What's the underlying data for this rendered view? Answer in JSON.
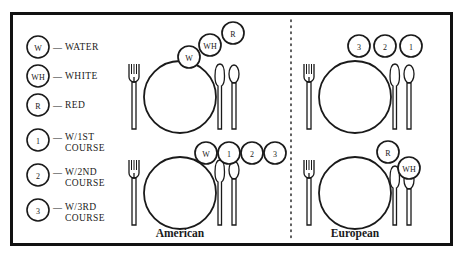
{
  "figure": {
    "title_visible": false,
    "background_color": "#ffffff",
    "ink_color": "#1a1a1a",
    "border": {
      "color": "#111111",
      "width_px": 3
    }
  },
  "legend": {
    "name": "glassware-legend",
    "items": [
      {
        "id": "W",
        "symbol": "W",
        "dash": "—",
        "label": "WATER",
        "label2": ""
      },
      {
        "id": "WH",
        "symbol": "WH",
        "dash": "—",
        "label": "WHITE",
        "label2": ""
      },
      {
        "id": "R",
        "symbol": "R",
        "dash": "—",
        "label": "RED",
        "label2": ""
      },
      {
        "id": "1",
        "symbol": "1",
        "dash": "—",
        "label": "W/1ST",
        "label2": "COURSE"
      },
      {
        "id": "2",
        "symbol": "2",
        "dash": "—",
        "label": "W/2ND",
        "label2": "COURSE"
      },
      {
        "id": "3",
        "symbol": "3",
        "dash": "—",
        "label": "W/3RD",
        "label2": "COURSE"
      }
    ]
  },
  "divider": {
    "name": "vertical-dotted-divider",
    "style": "dotted"
  },
  "panels": [
    {
      "name": "american-panel",
      "caption": "American",
      "settings": [
        {
          "name": "american-setting-top",
          "glass_layout": "diagonal-ascending",
          "glasses": [
            "W",
            "WH",
            "R"
          ],
          "utensils": [
            "fork",
            "knife",
            "spoon"
          ]
        },
        {
          "name": "american-setting-bottom",
          "glass_layout": "horizontal-row",
          "glasses": [
            "W",
            "1",
            "2",
            "3"
          ],
          "utensils": [
            "fork",
            "knife",
            "spoon"
          ]
        }
      ]
    },
    {
      "name": "european-panel",
      "caption": "European",
      "settings": [
        {
          "name": "european-setting-top",
          "glass_layout": "horizontal-row",
          "glasses": [
            "3",
            "2",
            "1"
          ],
          "utensils": [
            "fork",
            "knife",
            "spoon"
          ]
        },
        {
          "name": "european-setting-bottom",
          "glass_layout": "diagonal-descending",
          "glasses": [
            "R",
            "WH"
          ],
          "utensils": [
            "fork",
            "knife",
            "spoon"
          ]
        }
      ]
    }
  ]
}
